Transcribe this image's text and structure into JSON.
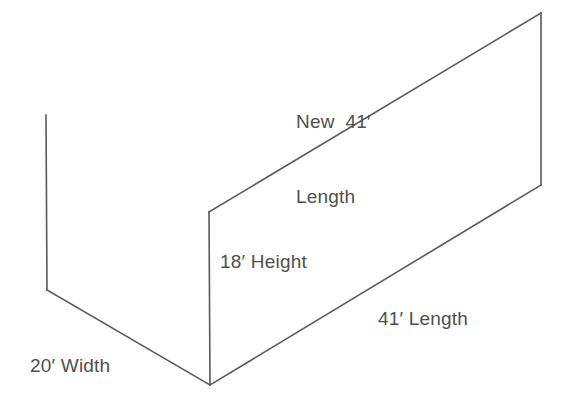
{
  "diagram": {
    "stroke_color": "#5a5a5a",
    "text_color": "#4f4f4f",
    "background_color": "#ffffff",
    "labels": {
      "new_length_line1": "New  41′",
      "new_length_line2": "Length",
      "height": "18′ Height",
      "length": "41′ Length",
      "width": "20′ Width"
    },
    "measurements": [
      {
        "name": "new-length",
        "value": 41,
        "unit": "ft",
        "text": "New  41′ Length"
      },
      {
        "name": "height",
        "value": 18,
        "unit": "ft",
        "text": "18′ Height"
      },
      {
        "name": "length",
        "value": 41,
        "unit": "ft",
        "text": "41′ Length"
      },
      {
        "name": "width",
        "value": 20,
        "unit": "ft",
        "text": "20′ Width"
      }
    ],
    "vertices": {
      "back_left_top": [
        46,
        115
      ],
      "back_left_bottom": [
        47,
        290
      ],
      "front_bottom": [
        210,
        385
      ],
      "wall_front_top": [
        209,
        212
      ],
      "wall_back_top": [
        541,
        13
      ],
      "wall_back_bottom": [
        541,
        185
      ]
    }
  }
}
